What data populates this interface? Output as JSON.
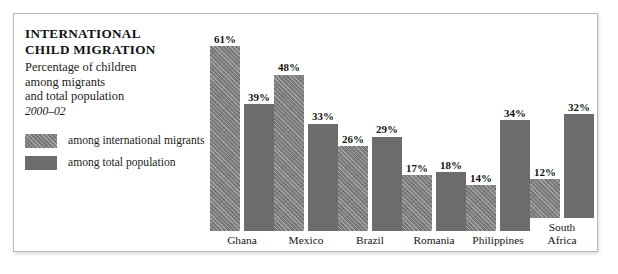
{
  "panel": {
    "title_line1": "INTERNATIONAL",
    "title_line2": "CHILD MIGRATION",
    "subtitle_line1": "Percentage of children",
    "subtitle_line2": "among migrants",
    "subtitle_line3": "and total population",
    "date_range": "2000–02"
  },
  "legend": {
    "items": [
      {
        "label": "among international migrants",
        "swatch": "hatched-gray",
        "color": "#7e7e7e"
      },
      {
        "label": "among total population",
        "swatch": "solid-gray",
        "color": "#6c6c6c"
      }
    ]
  },
  "chart_data": {
    "type": "bar",
    "title": "INTERNATIONAL CHILD MIGRATION",
    "subtitle": "Percentage of children among migrants and total population, 2000–02",
    "xlabel": "",
    "ylabel": "",
    "ylim": [
      0,
      61
    ],
    "grid": false,
    "legend_position": "left",
    "value_suffix": "%",
    "categories": [
      "Ghana",
      "Mexico",
      "Brazil",
      "Romania",
      "Philippines",
      "South\nAfrica"
    ],
    "series": [
      {
        "name": "among international migrants",
        "color": "#7e7e7e",
        "values": [
          61,
          48,
          26,
          17,
          14,
          12
        ],
        "labels": [
          "61%",
          "48%",
          "26%",
          "17%",
          "14%",
          "12%"
        ]
      },
      {
        "name": "among total population",
        "color": "#6c6c6c",
        "values": [
          39,
          33,
          29,
          18,
          34,
          32
        ],
        "labels": [
          "39%",
          "33%",
          "29%",
          "18%",
          "34%",
          "32%"
        ]
      }
    ]
  }
}
